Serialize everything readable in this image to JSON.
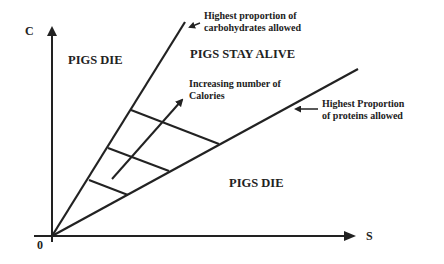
{
  "diagram": {
    "axes": {
      "y_label": "C",
      "x_label": "S",
      "origin_label": "0"
    },
    "regions": {
      "top_left": "PIGS DIE",
      "middle": "PIGS STAY ALIVE",
      "bottom_right": "PIGS DIE"
    },
    "annotations": {
      "upper_line": {
        "line1": "Highest proportion of",
        "line2": "carbohydrates allowed"
      },
      "lower_line": {
        "line1": "Highest Proportion",
        "line2": "of proteins allowed"
      },
      "arrow_label": {
        "line1": "Increasing number of",
        "line2": "Calories"
      }
    },
    "colors": {
      "line": "#222222",
      "background": "#ffffff"
    }
  }
}
